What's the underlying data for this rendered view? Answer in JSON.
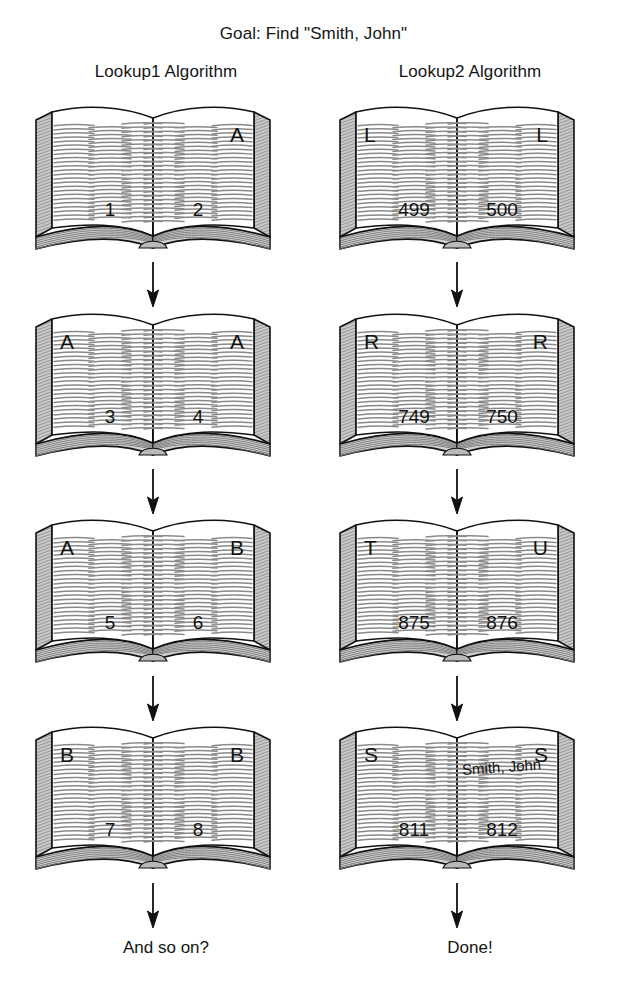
{
  "title": "Goal: Find \"Smith, John\"",
  "columns": [
    {
      "id": "lookup1",
      "header": "Lookup1 Algorithm",
      "caption": "And so on?"
    },
    {
      "id": "lookup2",
      "header": "Lookup2 Algorithm",
      "caption": "Done!"
    }
  ],
  "lookup1": {
    "header": "Lookup1 Algorithm",
    "caption": "And so on?",
    "steps": [
      {
        "left_letter": "",
        "right_letter": "A",
        "left_page": "1",
        "right_page": "2",
        "entry": ""
      },
      {
        "left_letter": "A",
        "right_letter": "A",
        "left_page": "3",
        "right_page": "4",
        "entry": ""
      },
      {
        "left_letter": "A",
        "right_letter": "B",
        "left_page": "5",
        "right_page": "6",
        "entry": ""
      },
      {
        "left_letter": "B",
        "right_letter": "B",
        "left_page": "7",
        "right_page": "8",
        "entry": ""
      }
    ]
  },
  "lookup2": {
    "header": "Lookup2 Algorithm",
    "caption": "Done!",
    "steps": [
      {
        "left_letter": "L",
        "right_letter": "L",
        "left_page": "499",
        "right_page": "500",
        "entry": ""
      },
      {
        "left_letter": "R",
        "right_letter": "R",
        "left_page": "749",
        "right_page": "750",
        "entry": ""
      },
      {
        "left_letter": "T",
        "right_letter": "U",
        "left_page": "875",
        "right_page": "876",
        "entry": ""
      },
      {
        "left_letter": "S",
        "right_letter": "S",
        "left_page": "811",
        "right_page": "812",
        "entry": "Smith, John"
      }
    ]
  },
  "colors": {
    "ink": "#111111",
    "page_line": "#8a8a8a",
    "edge_fill": "#c9c9c9",
    "stack_fill": "#d0d0d0",
    "background": "#ffffff"
  },
  "icons": {
    "book": "open-book-icon",
    "arrow": "down-arrow-icon"
  }
}
